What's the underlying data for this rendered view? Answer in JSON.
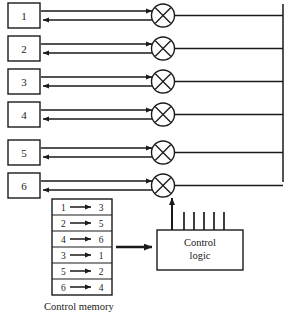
{
  "figure": {
    "kind": "crossbar-switch-diagram",
    "colors": {
      "line": "#1a1a1a",
      "background": "#ffffff",
      "box_fill": "#ffffff"
    }
  },
  "ports": {
    "label": "input-output ports",
    "items": [
      {
        "id": "port-1",
        "label": "1"
      },
      {
        "id": "port-2",
        "label": "2"
      },
      {
        "id": "port-3",
        "label": "3"
      },
      {
        "id": "port-4",
        "label": "4"
      },
      {
        "id": "port-5",
        "label": "5"
      },
      {
        "id": "port-6",
        "label": "6"
      }
    ]
  },
  "crosspoints": {
    "icon": "crossbar-crosspoint-icon",
    "count": 6,
    "glyph": "circle-with-x"
  },
  "control_memory": {
    "caption": "Control memory",
    "arrow_glyph": "→",
    "rows": [
      {
        "from": "1",
        "arrow": "→",
        "to": "3"
      },
      {
        "from": "2",
        "arrow": "→",
        "to": "5"
      },
      {
        "from": "4",
        "arrow": "→",
        "to": "6"
      },
      {
        "from": "3",
        "arrow": "→",
        "to": "1"
      },
      {
        "from": "5",
        "arrow": "→",
        "to": "2"
      },
      {
        "from": "6",
        "arrow": "→",
        "to": "4"
      }
    ]
  },
  "control_logic": {
    "line1": "Control",
    "line2": "logic",
    "control_line_count": 6
  }
}
